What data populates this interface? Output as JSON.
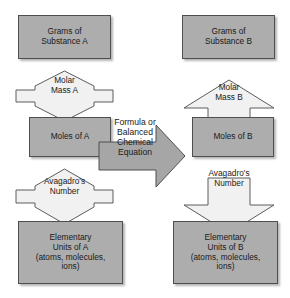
{
  "diagram": {
    "colors": {
      "box_fill": "#adadad",
      "box_border": "#4f4f4f",
      "light_arrow_fill": "#f1f1f1",
      "light_arrow_border": "#5c5c5c",
      "center_arrow_fill": "#a6a6a6",
      "center_arrow_border": "#4f4f4f",
      "text": "#1a1a1a",
      "background": "#ffffff"
    },
    "nodes": {
      "grams_a": {
        "label": "Grams of\nSubstance A",
        "shape": "rectangle"
      },
      "grams_b": {
        "label": "Grams of\nSubstance B",
        "shape": "rectangle"
      },
      "molar_mass_a": {
        "label": "Molar\nMass A",
        "shape": "double-arrow-vertical"
      },
      "molar_mass_b": {
        "label": "Molar\nMass B",
        "shape": "arrow-up"
      },
      "moles_a": {
        "label": "Moles of A",
        "shape": "rectangle"
      },
      "moles_b": {
        "label": "Moles of B",
        "shape": "rectangle"
      },
      "formula": {
        "label": "Formula or\nBalanced Chemical\nEquation",
        "shape": "arrow-right"
      },
      "avagadro_a": {
        "label": "Avagadro's\nNumber",
        "shape": "double-arrow-vertical"
      },
      "avagadro_b": {
        "label": "Avagadro's\nNumber",
        "shape": "arrow-down"
      },
      "units_a": {
        "label": "Elementary\nUnits of A\n(atoms, molecules,\nions)",
        "shape": "rectangle"
      },
      "units_b": {
        "label": "Elementary\nUnits of B\n(atoms, molecules,\nions)",
        "shape": "rectangle"
      }
    }
  }
}
